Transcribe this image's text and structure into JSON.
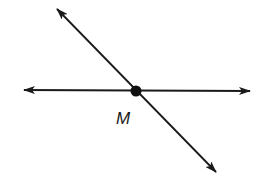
{
  "diagram": {
    "colors": {
      "stroke": "#1a1a1a",
      "background": "#ffffff"
    },
    "lines": [
      {
        "name": "horizontal-line",
        "from": [
          24,
          90
        ],
        "to": [
          250,
          91
        ],
        "arrows": "both"
      },
      {
        "name": "diagonal-line",
        "from": [
          57,
          9
        ],
        "to": [
          216,
          172
        ],
        "arrows": "both"
      }
    ],
    "points": [
      {
        "label": "M",
        "x": 136,
        "y": 91,
        "label_x": 123,
        "label_y": 124
      }
    ]
  }
}
